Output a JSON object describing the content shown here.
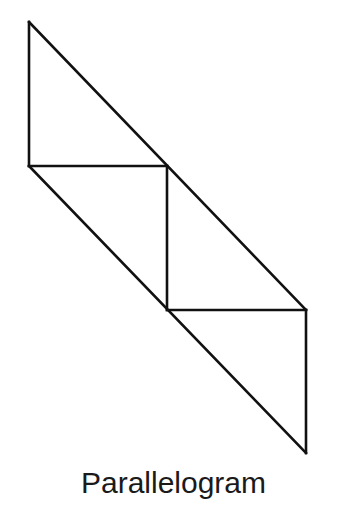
{
  "diagram": {
    "caption": "Parallelogram",
    "stroke_color": "#111111",
    "stroke_width": 2.6,
    "vertices": {
      "top_left": [
        29,
        22
      ],
      "mid_left": [
        29,
        166
      ],
      "middle_junction": [
        167,
        166
      ],
      "lower_junction": [
        167,
        310
      ],
      "right_mid": [
        306,
        310
      ],
      "bottom_right": [
        306,
        453
      ]
    },
    "segments": [
      {
        "name": "left-vertical-edge",
        "from": "top_left",
        "to": "mid_left"
      },
      {
        "name": "top-diagonal-edge",
        "from": "top_left",
        "to": "right_mid"
      },
      {
        "name": "upper-horizontal-divider",
        "from": "mid_left",
        "to": "middle_junction"
      },
      {
        "name": "bottom-diagonal-edge",
        "from": "mid_left",
        "to": "bottom_right"
      },
      {
        "name": "center-vertical-divider",
        "from": "middle_junction",
        "to": "lower_junction"
      },
      {
        "name": "lower-horizontal-divider",
        "from": "lower_junction",
        "to": "right_mid"
      },
      {
        "name": "right-vertical-edge",
        "from": "right_mid",
        "to": "bottom_right"
      }
    ],
    "regions": [
      {
        "name": "upper-triangle"
      },
      {
        "name": "middle-left-triangle"
      },
      {
        "name": "middle-right-triangle"
      },
      {
        "name": "lower-triangle"
      }
    ]
  }
}
